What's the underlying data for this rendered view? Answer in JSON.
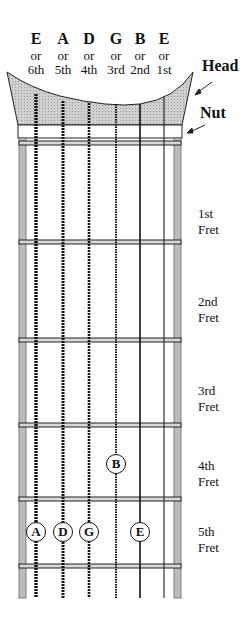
{
  "strings": [
    {
      "name": "E",
      "or": "or",
      "ordinal": "6th",
      "x": 36
    },
    {
      "name": "A",
      "or": "or",
      "ordinal": "5th",
      "x": 63
    },
    {
      "name": "D",
      "or": "or",
      "ordinal": "4th",
      "x": 89
    },
    {
      "name": "G",
      "or": "or",
      "ordinal": "3rd",
      "x": 116
    },
    {
      "name": "B",
      "or": "or",
      "ordinal": "2nd",
      "x": 140
    },
    {
      "name": "E",
      "or": "or",
      "ordinal": "1st",
      "x": 164
    }
  ],
  "callouts": {
    "head": "Head",
    "nut": "Nut"
  },
  "frets": [
    {
      "ordinal": "1st",
      "word": "Fret"
    },
    {
      "ordinal": "2nd",
      "word": "Fret"
    },
    {
      "ordinal": "3rd",
      "word": "Fret"
    },
    {
      "ordinal": "4th",
      "word": "Fret"
    },
    {
      "ordinal": "5th",
      "word": "Fret"
    }
  ],
  "notes": [
    {
      "label": "B",
      "string": "G (3rd)",
      "fret": 4
    },
    {
      "label": "A",
      "string": "E (6th)",
      "fret": 5
    },
    {
      "label": "D",
      "string": "A (5th)",
      "fret": 5
    },
    {
      "label": "G",
      "string": "D (4th)",
      "fret": 5
    },
    {
      "label": "E",
      "string": "B (2nd)",
      "fret": 5
    }
  ],
  "colors": {
    "head_fill": "#c8c8c8",
    "board_edge": "#bdbdbd",
    "line": "#111111"
  }
}
